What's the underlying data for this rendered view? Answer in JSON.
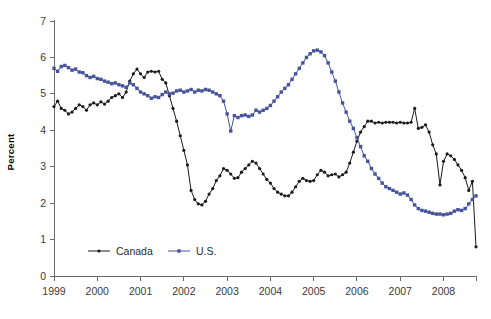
{
  "chart_data": {
    "type": "line",
    "title": "",
    "xlabel": "",
    "ylabel": "Percent",
    "ylim": [
      0,
      7
    ],
    "xlim": [
      1999,
      2008.75
    ],
    "grid": false,
    "legend_position": "inside-bottom-left",
    "y_ticks": [
      "0",
      "1",
      "2",
      "3",
      "4",
      "5",
      "6",
      "7"
    ],
    "x_ticks": [
      "1999",
      "2000",
      "2001",
      "2002",
      "2003",
      "2004",
      "2005",
      "2006",
      "2007",
      "2008"
    ],
    "series": [
      {
        "name": "Canada",
        "color": "#1a1a1a",
        "marker": "circle",
        "x": [
          1999.0,
          1999.083,
          1999.167,
          1999.25,
          1999.333,
          1999.417,
          1999.5,
          1999.583,
          1999.667,
          1999.75,
          1999.833,
          1999.917,
          2000.0,
          2000.083,
          2000.167,
          2000.25,
          2000.333,
          2000.417,
          2000.5,
          2000.583,
          2000.667,
          2000.75,
          2000.833,
          2000.917,
          2001.0,
          2001.083,
          2001.167,
          2001.25,
          2001.333,
          2001.417,
          2001.5,
          2001.583,
          2001.667,
          2001.75,
          2001.833,
          2001.917,
          2002.0,
          2002.083,
          2002.167,
          2002.25,
          2002.333,
          2002.417,
          2002.5,
          2002.583,
          2002.667,
          2002.75,
          2002.833,
          2002.917,
          2003.0,
          2003.083,
          2003.167,
          2003.25,
          2003.333,
          2003.417,
          2003.5,
          2003.583,
          2003.667,
          2003.75,
          2003.833,
          2003.917,
          2004.0,
          2004.083,
          2004.167,
          2004.25,
          2004.333,
          2004.417,
          2004.5,
          2004.583,
          2004.667,
          2004.75,
          2004.833,
          2004.917,
          2005.0,
          2005.083,
          2005.167,
          2005.25,
          2005.333,
          2005.417,
          2005.5,
          2005.583,
          2005.667,
          2005.75,
          2005.833,
          2005.917,
          2006.0,
          2006.083,
          2006.167,
          2006.25,
          2006.333,
          2006.417,
          2006.5,
          2006.583,
          2006.667,
          2006.75,
          2006.833,
          2006.917,
          2007.0,
          2007.083,
          2007.167,
          2007.25,
          2007.333,
          2007.417,
          2007.5,
          2007.583,
          2007.667,
          2007.75,
          2007.833,
          2007.917,
          2008.0,
          2008.083,
          2008.167,
          2008.25,
          2008.333,
          2008.417,
          2008.5,
          2008.583,
          2008.667,
          2008.75
        ],
        "values": [
          4.65,
          4.8,
          4.6,
          4.55,
          4.45,
          4.5,
          4.6,
          4.7,
          4.65,
          4.55,
          4.7,
          4.75,
          4.7,
          4.78,
          4.72,
          4.8,
          4.9,
          4.95,
          5.0,
          4.9,
          5.05,
          5.35,
          5.55,
          5.68,
          5.55,
          5.45,
          5.6,
          5.62,
          5.6,
          5.62,
          5.4,
          5.3,
          4.95,
          4.6,
          4.25,
          3.85,
          3.45,
          3.05,
          2.35,
          2.1,
          1.98,
          1.95,
          2.05,
          2.25,
          2.4,
          2.62,
          2.75,
          2.95,
          2.9,
          2.8,
          2.68,
          2.7,
          2.85,
          2.95,
          3.05,
          3.15,
          3.1,
          2.95,
          2.8,
          2.65,
          2.55,
          2.4,
          2.3,
          2.25,
          2.2,
          2.2,
          2.3,
          2.45,
          2.6,
          2.68,
          2.62,
          2.6,
          2.62,
          2.78,
          2.9,
          2.85,
          2.75,
          2.78,
          2.8,
          2.72,
          2.78,
          2.85,
          3.1,
          3.4,
          3.7,
          3.95,
          4.1,
          4.25,
          4.25,
          4.2,
          4.22,
          4.2,
          4.22,
          4.22,
          4.22,
          4.2,
          4.22,
          4.2,
          4.2,
          4.22,
          4.6,
          4.05,
          4.08,
          4.15,
          3.95,
          3.6,
          3.35,
          2.5,
          3.15,
          3.35,
          3.3,
          3.2,
          3.05,
          2.9,
          2.7,
          2.35,
          2.6,
          0.8
        ]
      },
      {
        "name": "U.S.",
        "color": "#46539b",
        "marker": "square",
        "x": [
          1999.0,
          1999.083,
          1999.167,
          1999.25,
          1999.333,
          1999.417,
          1999.5,
          1999.583,
          1999.667,
          1999.75,
          1999.833,
          1999.917,
          2000.0,
          2000.083,
          2000.167,
          2000.25,
          2000.333,
          2000.417,
          2000.5,
          2000.583,
          2000.667,
          2000.75,
          2000.833,
          2000.917,
          2001.0,
          2001.083,
          2001.167,
          2001.25,
          2001.333,
          2001.417,
          2001.5,
          2001.583,
          2001.667,
          2001.75,
          2001.833,
          2001.917,
          2002.0,
          2002.083,
          2002.167,
          2002.25,
          2002.333,
          2002.417,
          2002.5,
          2002.583,
          2002.667,
          2002.75,
          2002.833,
          2002.917,
          2003.0,
          2003.083,
          2003.167,
          2003.25,
          2003.333,
          2003.417,
          2003.5,
          2003.583,
          2003.667,
          2003.75,
          2003.833,
          2003.917,
          2004.0,
          2004.083,
          2004.167,
          2004.25,
          2004.333,
          2004.417,
          2004.5,
          2004.583,
          2004.667,
          2004.75,
          2004.833,
          2004.917,
          2005.0,
          2005.083,
          2005.167,
          2005.25,
          2005.333,
          2005.417,
          2005.5,
          2005.583,
          2005.667,
          2005.75,
          2005.833,
          2005.917,
          2006.0,
          2006.083,
          2006.167,
          2006.25,
          2006.333,
          2006.417,
          2006.5,
          2006.583,
          2006.667,
          2006.75,
          2006.833,
          2006.917,
          2007.0,
          2007.083,
          2007.167,
          2007.25,
          2007.333,
          2007.417,
          2007.5,
          2007.583,
          2007.667,
          2007.75,
          2007.833,
          2007.917,
          2008.0,
          2008.083,
          2008.167,
          2008.25,
          2008.333,
          2008.417,
          2008.5,
          2008.583,
          2008.667,
          2008.75
        ],
        "values": [
          5.7,
          5.62,
          5.75,
          5.78,
          5.72,
          5.65,
          5.68,
          5.6,
          5.58,
          5.5,
          5.45,
          5.48,
          5.42,
          5.4,
          5.35,
          5.32,
          5.28,
          5.3,
          5.25,
          5.22,
          5.18,
          5.3,
          5.25,
          5.15,
          5.05,
          5.0,
          4.95,
          4.88,
          4.92,
          4.9,
          4.98,
          5.05,
          5.0,
          5.02,
          5.08,
          5.1,
          5.05,
          5.08,
          5.12,
          5.05,
          5.1,
          5.08,
          5.12,
          5.1,
          5.05,
          5.0,
          4.95,
          4.8,
          4.45,
          3.98,
          4.4,
          4.35,
          4.4,
          4.42,
          4.38,
          4.42,
          4.55,
          4.5,
          4.55,
          4.6,
          4.68,
          4.8,
          4.92,
          5.05,
          5.15,
          5.25,
          5.4,
          5.55,
          5.7,
          5.85,
          6.0,
          6.1,
          6.18,
          6.2,
          6.15,
          6.05,
          5.85,
          5.6,
          5.35,
          5.05,
          4.75,
          4.5,
          4.25,
          4.05,
          3.8,
          3.55,
          3.3,
          3.15,
          2.95,
          2.8,
          2.68,
          2.55,
          2.45,
          2.4,
          2.35,
          2.3,
          2.25,
          2.28,
          2.22,
          2.1,
          1.95,
          1.85,
          1.8,
          1.78,
          1.75,
          1.72,
          1.7,
          1.7,
          1.68,
          1.7,
          1.72,
          1.78,
          1.82,
          1.8,
          1.85,
          1.98,
          2.1,
          2.2
        ]
      }
    ]
  },
  "legend": {
    "entries": [
      {
        "label": "Canada",
        "color": "#1a1a1a"
      },
      {
        "label": "U.S.",
        "color": "#46539b"
      }
    ]
  },
  "axes": {
    "y_title": "Percent"
  }
}
